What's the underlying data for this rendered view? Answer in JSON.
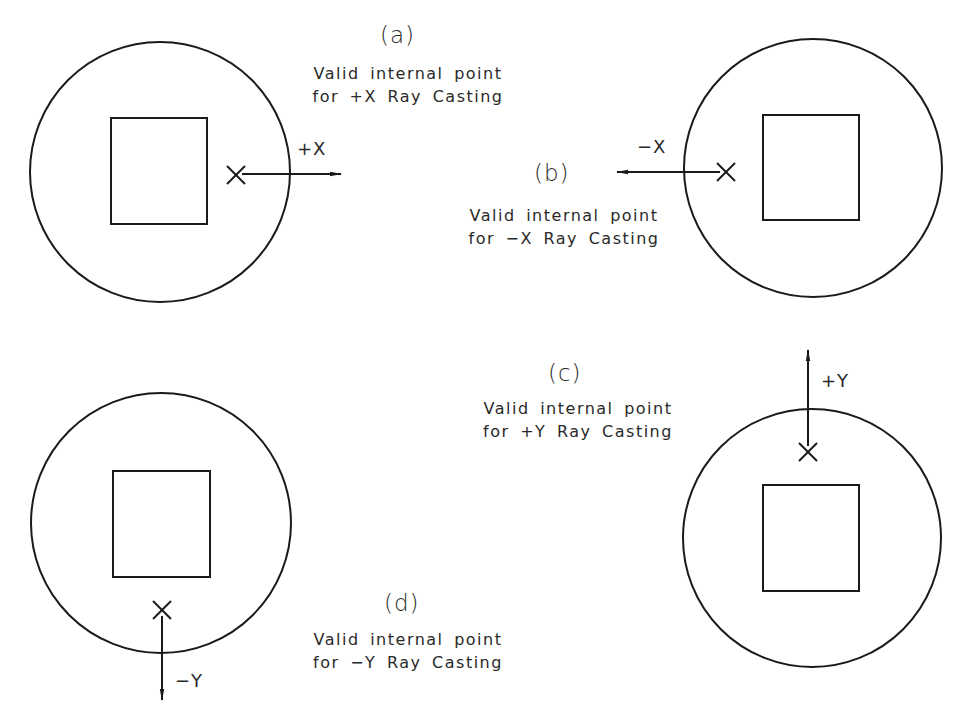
{
  "figure": {
    "stroke_color": "#1a1a1a",
    "background": "#ffffff",
    "panels": [
      {
        "id": "a",
        "letter": "(a)",
        "caption_line1": "Valid internal point",
        "caption_line2": "for +X Ray Casting",
        "direction_label": "+X",
        "circle": {
          "cx": 160,
          "cy": 172,
          "r": 130
        },
        "square": {
          "x": 111,
          "y": 118,
          "w": 96,
          "h": 106
        },
        "point": {
          "x": 236,
          "y": 175
        },
        "ray": {
          "x1": 242,
          "y1": 174,
          "x2": 341,
          "y2": 174
        }
      },
      {
        "id": "b",
        "letter": "(b)",
        "caption_line1": "Valid internal point",
        "caption_line2": "for −X Ray Casting",
        "direction_label": "−X",
        "circle": {
          "cx": 813,
          "cy": 168,
          "r": 129
        },
        "square": {
          "x": 763,
          "y": 115,
          "w": 96,
          "h": 105
        },
        "point": {
          "x": 726,
          "y": 172
        },
        "ray": {
          "x1": 720,
          "y1": 172,
          "x2": 617,
          "y2": 172
        }
      },
      {
        "id": "c",
        "letter": "(c)",
        "caption_line1": "Valid internal point",
        "caption_line2": "for +Y Ray Casting",
        "direction_label": "+Y",
        "circle": {
          "cx": 812,
          "cy": 538,
          "r": 129
        },
        "square": {
          "x": 763,
          "y": 485,
          "w": 96,
          "h": 106
        },
        "point": {
          "x": 808,
          "y": 452
        },
        "ray": {
          "x1": 808,
          "y1": 446,
          "x2": 808,
          "y2": 350
        }
      },
      {
        "id": "d",
        "letter": "(d)",
        "caption_line1": "Valid internal point",
        "caption_line2": "for −Y Ray Casting",
        "direction_label": "−Y",
        "circle": {
          "cx": 161,
          "cy": 523,
          "r": 130
        },
        "square": {
          "x": 113,
          "y": 471,
          "w": 97,
          "h": 106
        },
        "point": {
          "x": 162,
          "y": 610
        },
        "ray": {
          "x1": 162,
          "y1": 616,
          "x2": 162,
          "y2": 700
        }
      }
    ]
  }
}
